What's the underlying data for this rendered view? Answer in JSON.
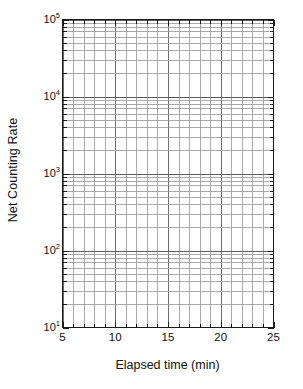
{
  "chart_data": {
    "type": "line",
    "title": "",
    "xlabel": "Elapsed time (min)",
    "ylabel": "Net Counting Rate",
    "xscale": "linear",
    "yscale": "log",
    "xlim": [
      5,
      25
    ],
    "ylim": [
      10,
      100000
    ],
    "grid": true,
    "grid_minor": true,
    "legend": false,
    "series": [],
    "x": [],
    "values": [],
    "xticks": [
      5,
      10,
      15,
      20,
      25
    ],
    "xtick_labels": [
      "5",
      "10",
      "15",
      "20",
      "25"
    ],
    "xticks_minor": [
      6,
      7,
      8,
      9,
      11,
      12,
      13,
      14,
      16,
      17,
      18,
      19,
      21,
      22,
      23,
      24
    ],
    "yticks": [
      10,
      100,
      1000,
      10000,
      100000
    ],
    "ytick_labels": [
      "10",
      "10",
      "10",
      "10",
      "10"
    ],
    "ytick_exponents": [
      "1",
      "2",
      "3",
      "4",
      "5"
    ],
    "yticks_minor_multipliers": [
      2,
      3,
      4,
      5,
      6,
      7,
      8,
      9
    ],
    "axis_color": "#1a1a1a",
    "grid_color": "#9a9a9a",
    "background": "#ffffff",
    "annotations": [],
    "note": "Empty semi-logarithmic grid; no data points plotted"
  },
  "axes": {
    "x_title": "Elapsed time (min)",
    "y_title": "Net Counting Rate"
  }
}
